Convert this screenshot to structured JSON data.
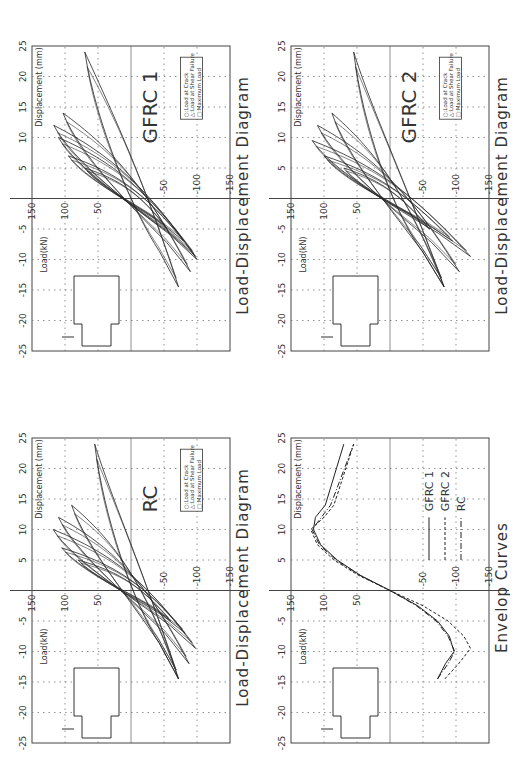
{
  "common": {
    "y_axis_label": "Load(kN)",
    "x_axis_label": "Displacement (mm)",
    "x_ticks": [
      "-25",
      "-20",
      "-15",
      "-10",
      "-5",
      "5",
      "10",
      "15",
      "20",
      "25"
    ],
    "y_ticks": [
      "150",
      "100",
      "50",
      "-50",
      "-100",
      "-150"
    ],
    "marker_legend": [
      "○:Load at Crack",
      "△:Load at Shear Failure",
      "□:Maximum Load"
    ]
  },
  "panels": {
    "gfrc1": {
      "title": "Load-Displacement Diagram",
      "label": "GFRC 1"
    },
    "gfrc2": {
      "title": "Load-Displacement Diagram",
      "label": "GFRC 2"
    },
    "rc": {
      "title": "Load-Displacement Diagram",
      "label": "RC"
    },
    "envelop": {
      "title": "Envelop Curves",
      "legend": [
        "GFRC 1",
        "GFRC 2",
        "RC"
      ]
    }
  },
  "chart_data": [
    {
      "type": "line",
      "title": "Load-Displacement Diagram",
      "subtitle": "GFRC 1",
      "xlabel": "Displacement (mm)",
      "ylabel": "Load(kN)",
      "xlim": [
        -25,
        25
      ],
      "ylim": [
        -150,
        150
      ],
      "grid": true,
      "annotations": [
        "○:Load at Crack",
        "△:Load at Shear Failure",
        "□:Maximum Load"
      ],
      "series": [
        {
          "name": "hysteresis loops",
          "peaks_positive": [
            [
              5,
              70
            ],
            [
              7,
              95
            ],
            [
              10,
              110
            ],
            [
              12,
              117
            ],
            [
              14,
              103
            ],
            [
              24,
              70
            ]
          ],
          "peaks_negative": [
            [
              -5,
              -55
            ],
            [
              -7,
              -80
            ],
            [
              -9.5,
              -98
            ],
            [
              -10,
              -100
            ],
            [
              -12,
              -90
            ],
            [
              -14.5,
              -72
            ]
          ]
        }
      ]
    },
    {
      "type": "line",
      "title": "Load-Displacement Diagram",
      "subtitle": "GFRC 2",
      "xlabel": "Displacement (mm)",
      "ylabel": "Load(kN)",
      "xlim": [
        -25,
        25
      ],
      "ylim": [
        -150,
        150
      ],
      "grid": true,
      "annotations": [
        "○:Load at Crack",
        "△:Load at Shear Failure",
        "□:Maximum Load"
      ],
      "series": [
        {
          "name": "hysteresis loops",
          "peaks_positive": [
            [
              5,
              70
            ],
            [
              7,
              100
            ],
            [
              9.5,
              118
            ],
            [
              12,
              110
            ],
            [
              14,
              88
            ],
            [
              24,
              55
            ]
          ],
          "peaks_negative": [
            [
              -5,
              -60
            ],
            [
              -7,
              -95
            ],
            [
              -9.5,
              -122
            ],
            [
              -12,
              -105
            ],
            [
              -14.5,
              -82
            ]
          ]
        }
      ]
    },
    {
      "type": "line",
      "title": "Load-Displacement Diagram",
      "subtitle": "RC",
      "xlabel": "Displacement (mm)",
      "ylabel": "Load(kN)",
      "xlim": [
        -25,
        25
      ],
      "ylim": [
        -150,
        150
      ],
      "grid": true,
      "annotations": [
        "○:Load at Crack",
        "△:Load at Shear Failure",
        "□:Maximum Load"
      ],
      "series": [
        {
          "name": "hysteresis loops",
          "peaks_positive": [
            [
              5,
              80
            ],
            [
              7,
              105
            ],
            [
              10,
              118
            ],
            [
              12,
              110
            ],
            [
              14,
              90
            ],
            [
              24,
              55
            ]
          ],
          "peaks_negative": [
            [
              -5,
              -60
            ],
            [
              -7,
              -82
            ],
            [
              -9.5,
              -98
            ],
            [
              -12,
              -88
            ],
            [
              -14.5,
              -72
            ]
          ]
        }
      ]
    },
    {
      "type": "line",
      "title": "Envelop Curves",
      "xlabel": "Displacement (mm)",
      "ylabel": "Load(kN)",
      "xlim": [
        -25,
        25
      ],
      "ylim": [
        -150,
        150
      ],
      "grid": true,
      "legend_position": "lower right",
      "series": [
        {
          "name": "GFRC 1",
          "style": "solid",
          "x": [
            -14.5,
            -12,
            -10,
            -7.5,
            -5,
            -2.5,
            0,
            2.5,
            5,
            7.5,
            10,
            12,
            14,
            24
          ],
          "y": [
            -72,
            -84,
            -97,
            -90,
            -72,
            -42,
            0,
            45,
            80,
            105,
            116,
            113,
            98,
            70
          ]
        },
        {
          "name": "GFRC 2",
          "style": "dashed",
          "x": [
            -14.5,
            -12,
            -9.5,
            -7.5,
            -5,
            -2.5,
            0,
            2.5,
            5,
            7.5,
            10,
            12,
            14,
            24
          ],
          "y": [
            -83,
            -104,
            -122,
            -112,
            -88,
            -50,
            0,
            48,
            85,
            110,
            120,
            100,
            85,
            55
          ]
        },
        {
          "name": "RC",
          "style": "dash-dot",
          "x": [
            -14.5,
            -12,
            -10,
            -7.5,
            -5,
            -2.5,
            0,
            2.5,
            5,
            7.5,
            10,
            12,
            14,
            24
          ],
          "y": [
            -72,
            -88,
            -98,
            -88,
            -70,
            -40,
            0,
            46,
            82,
            107,
            118,
            104,
            90,
            55
          ]
        }
      ]
    }
  ]
}
